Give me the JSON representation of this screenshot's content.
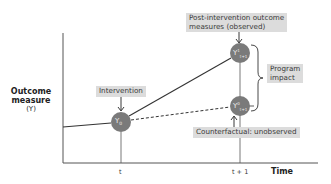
{
  "diagram": {
    "y_axis_label_line1": "Outcome",
    "y_axis_label_line2": "measure",
    "y_axis_label_line3": "(Y)",
    "x_axis_label": "Time",
    "x_ticks": [
      "t",
      "t + 1"
    ],
    "labels": {
      "intervention": "Intervention",
      "post_intervention_line1": "Post-intervention outcome",
      "post_intervention_line2": "measures (observed)",
      "program_impact_line1": "Program",
      "program_impact_line2": "impact",
      "counterfactual": "Counterfactual: unobserved"
    },
    "nodes": [
      {
        "id": "y0",
        "symbol": "Y",
        "sup": "",
        "sub": "0",
        "time": "t"
      },
      {
        "id": "y1_observed",
        "symbol": "Y",
        "sup": "1",
        "sub": "t+1",
        "time": "t + 1"
      },
      {
        "id": "y0_counterfactual",
        "symbol": "Y",
        "sup": "0",
        "sub": "t+1",
        "time": "t + 1"
      }
    ],
    "colors": {
      "node_fill": "#7a7a7a",
      "label_box": "#dcdcdc",
      "line": "#333333",
      "text": "#3a3a3a"
    }
  }
}
